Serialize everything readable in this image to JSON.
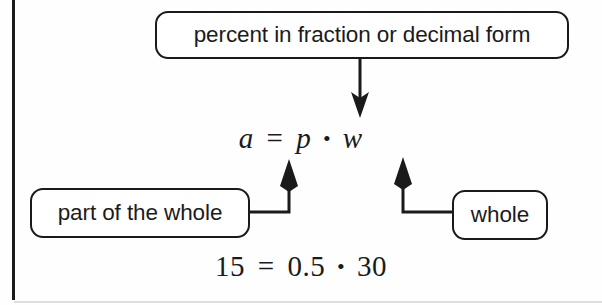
{
  "figure": {
    "kind": "concept-diagram",
    "topic": "percent-equation",
    "background_color": "#fefefe",
    "ink_color": "#1a1a1a"
  },
  "boxes": {
    "percent": {
      "label": "percent in fraction or decimal form",
      "points_to": "p"
    },
    "part": {
      "label": "part of the whole",
      "points_to": "a"
    },
    "whole": {
      "label": "whole",
      "points_to": "w"
    }
  },
  "equations": {
    "symbolic": {
      "left": "a",
      "equals": "=",
      "percent": "p",
      "times": "•",
      "whole": "w"
    },
    "numeric": {
      "left": "15",
      "equals": "=",
      "percent": "0.5",
      "times": "•",
      "whole": "30"
    }
  },
  "connectors": [
    {
      "name": "percent-arrow",
      "from": "percent-box",
      "to": "p-term",
      "direction": "down"
    },
    {
      "name": "part-arrow",
      "from": "part-box",
      "to": "a-term",
      "direction": "up-elbow-right"
    },
    {
      "name": "whole-arrow",
      "from": "whole-box",
      "to": "w-term",
      "direction": "up-elbow-left"
    }
  ]
}
